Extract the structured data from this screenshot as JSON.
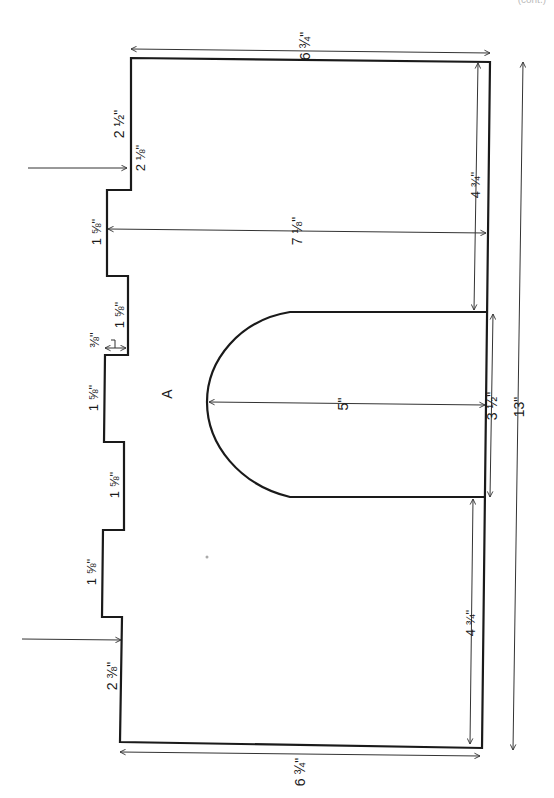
{
  "diagram": {
    "type": "sewing pattern piece with dimensions",
    "piece_label": "A",
    "corner_note": "(cont.)",
    "dimensions": {
      "top_width": "6 ¾\"",
      "bottom_width": "6 ¾\"",
      "overall_height": "13\"",
      "top_left_segment": "2 ½\"",
      "top_step_offset": "2 ⅛\"",
      "tab_1": "1 ⅝\"",
      "gap_1": "1 ⅝\"",
      "notch_depth": "⅜\"",
      "tab_2": "1 ⅝\"",
      "gap_2": "1 ⅝\"",
      "tab_3": "1 ⅝\"",
      "bottom_left_segment": "2 ⅜\"",
      "inner_width_to_tab": "7 ⅛\"",
      "upper_right_height": "4 ¾\"",
      "lower_right_height": "4 ¾\"",
      "arch_opening": "3 ½\"",
      "arch_depth": "5\""
    }
  }
}
